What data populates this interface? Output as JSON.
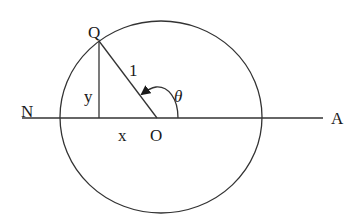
{
  "diagram": {
    "type": "unit-circle-geometry",
    "colors": {
      "line": "#333333",
      "text": "#1a1a1a",
      "background": "#ffffff"
    },
    "circle": {
      "cx": 161,
      "cy": 117,
      "rx": 101,
      "ry": 96
    },
    "axis_line": {
      "x1": 22,
      "x2": 323,
      "y": 118
    },
    "points": {
      "Q": {
        "label": "Q",
        "x": 99,
        "y": 41
      },
      "O": {
        "label": "O",
        "x": 157,
        "y": 118
      },
      "N": {
        "label": "N"
      },
      "A": {
        "label": "A"
      }
    },
    "labels": {
      "radius": "1",
      "vertical_leg": "y",
      "horizontal_leg": "x",
      "angle": "θ"
    }
  }
}
